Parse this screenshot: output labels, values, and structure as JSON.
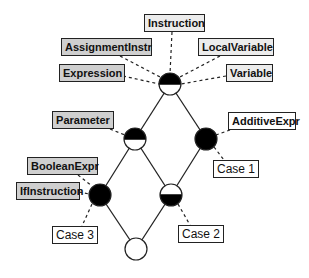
{
  "diagram": {
    "nodes": [
      {
        "id": "top",
        "fill": "top-half-black"
      },
      {
        "id": "param",
        "fill": "top-half-black"
      },
      {
        "id": "additive",
        "fill": "full-black"
      },
      {
        "id": "ifinst",
        "fill": "full-black"
      },
      {
        "id": "case2node",
        "fill": "bottom-half-black"
      },
      {
        "id": "bottom",
        "fill": "white"
      }
    ],
    "edges": [
      [
        "top",
        "param"
      ],
      [
        "top",
        "additive"
      ],
      [
        "param",
        "ifinst"
      ],
      [
        "param",
        "case2node"
      ],
      [
        "additive",
        "case2node"
      ],
      [
        "ifinst",
        "bottom"
      ],
      [
        "case2node",
        "bottom"
      ]
    ],
    "labels": {
      "instruction": "Instruction",
      "assignment_instr": "AssignmentInstr",
      "local_variable": "LocalVariable",
      "expression": "Expression",
      "variable": "Variable",
      "parameter": "Parameter",
      "additive_expr": "AdditiveExpr",
      "case1": "Case 1",
      "boolean_expr": "BooleanExpr",
      "if_instruction": "IfInstruction",
      "case3": "Case 3",
      "case2": "Case 2"
    },
    "colors": {
      "dark_label": "#cfcfcf",
      "light_label": "#ececec",
      "node_black": "#000000",
      "node_white": "#ffffff"
    }
  }
}
